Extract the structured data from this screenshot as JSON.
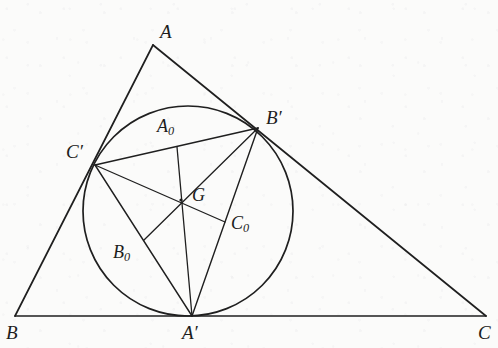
{
  "figure": {
    "stroke_color": "#1f1f1f",
    "background_color": "#fbfbfa",
    "width": 498,
    "height": 348
  },
  "points": {
    "A": {
      "label": "A",
      "x": 153,
      "y": 45,
      "label_x": 160,
      "label_y": 22,
      "font_size": 19
    },
    "B": {
      "label": "B",
      "x": 15,
      "y": 316,
      "label_x": 6,
      "label_y": 323,
      "font_size": 19
    },
    "C": {
      "label": "C",
      "x": 486,
      "y": 316,
      "label_x": 478,
      "label_y": 323,
      "font_size": 19
    },
    "Ap": {
      "label": "A′",
      "x": 192,
      "y": 316,
      "label_x": 182,
      "label_y": 323,
      "font_size": 19
    },
    "Bp": {
      "label": "B′",
      "x": 258,
      "y": 128,
      "label_x": 266,
      "label_y": 108,
      "font_size": 19
    },
    "Cp": {
      "label": "C′",
      "x": 95,
      "y": 165,
      "label_x": 66,
      "label_y": 142,
      "font_size": 19
    },
    "A0": {
      "label": "A",
      "sub": "0",
      "x": 177,
      "y": 147,
      "label_x": 157,
      "label_y": 117,
      "font_size": 18
    },
    "B0": {
      "label": "B",
      "sub": "0",
      "x": 144,
      "y": 240,
      "label_x": 113,
      "label_y": 243,
      "font_size": 18
    },
    "C0": {
      "label": "C",
      "sub": "0",
      "x": 225,
      "y": 222,
      "label_x": 231,
      "label_y": 214,
      "font_size": 18
    },
    "G": {
      "label": "G",
      "x": 181,
      "y": 200,
      "label_x": 192,
      "label_y": 186,
      "font_size": 18
    }
  },
  "incircle": {
    "center_x": 188,
    "center_y": 211,
    "radius": 105
  },
  "segments": [
    {
      "name": "side-AB",
      "from": "A",
      "to": "B"
    },
    {
      "name": "side-AC",
      "from": "A",
      "to": "C"
    },
    {
      "name": "side-BC",
      "from": "B",
      "to": "C"
    },
    {
      "name": "contact-CpBp",
      "from": "Cp",
      "to": "Bp"
    },
    {
      "name": "contact-CpAp",
      "from": "Cp",
      "to": "Ap"
    },
    {
      "name": "contact-ApBp",
      "from": "Ap",
      "to": "Bp"
    },
    {
      "name": "median-Ap-A0",
      "from": "Ap",
      "to": "A0"
    },
    {
      "name": "median-Bp-B0",
      "from": "Bp",
      "to": "B0"
    },
    {
      "name": "median-Cp-C0",
      "from": "Cp",
      "to": "C0"
    }
  ]
}
